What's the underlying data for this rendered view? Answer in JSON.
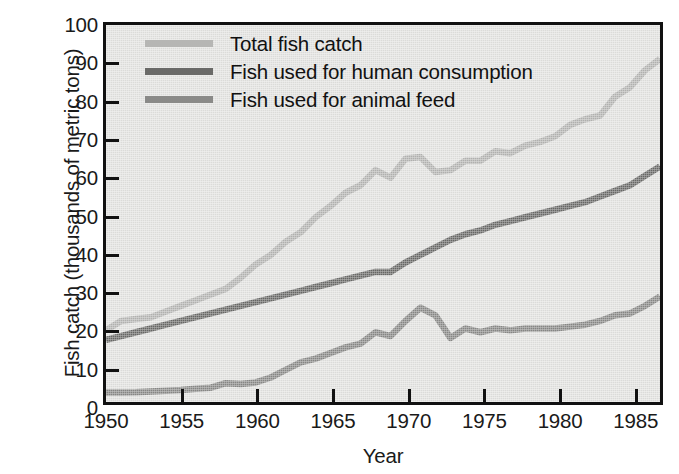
{
  "chart_data": {
    "type": "line",
    "title": "",
    "xlabel": "Year",
    "ylabel": "Fish catch (thousands of metric tons)",
    "xlim": [
      1950,
      1987
    ],
    "ylim": [
      0,
      100
    ],
    "xticks": [
      1950,
      1955,
      1960,
      1965,
      1970,
      1975,
      1980,
      1985
    ],
    "yticks": [
      0,
      10,
      20,
      30,
      40,
      50,
      60,
      70,
      80,
      90,
      100
    ],
    "grid": false,
    "legend_position": "top-left",
    "x": [
      1950,
      1951,
      1952,
      1953,
      1954,
      1955,
      1956,
      1957,
      1958,
      1959,
      1960,
      1961,
      1962,
      1963,
      1964,
      1965,
      1966,
      1967,
      1968,
      1969,
      1970,
      1971,
      1972,
      1973,
      1974,
      1975,
      1976,
      1977,
      1978,
      1979,
      1980,
      1981,
      1982,
      1983,
      1984,
      1985,
      1986,
      1987
    ],
    "series": [
      {
        "name": "Total fish catch",
        "color": "#b6b6b4",
        "values": [
          19.0,
          21.5,
          22.0,
          22.5,
          24.0,
          25.5,
          27.0,
          28.5,
          30.0,
          33.0,
          36.5,
          39.0,
          42.5,
          45.0,
          49.0,
          52.0,
          55.5,
          57.5,
          61.5,
          59.5,
          64.5,
          65.0,
          61.0,
          61.5,
          64.0,
          64.0,
          66.5,
          66.0,
          68.0,
          69.0,
          70.5,
          73.5,
          75.0,
          76.0,
          81.0,
          83.5,
          88.0,
          91.0
        ]
      },
      {
        "name": "Fish used for human consumption",
        "color": "#6a6a68",
        "values": [
          16.5,
          17.5,
          18.5,
          19.5,
          20.5,
          21.5,
          22.5,
          23.5,
          24.5,
          25.5,
          26.5,
          27.5,
          28.5,
          29.5,
          30.5,
          31.5,
          32.5,
          33.5,
          34.5,
          34.5,
          37.0,
          39.0,
          41.0,
          43.0,
          44.5,
          45.5,
          47.0,
          48.0,
          49.0,
          50.0,
          51.0,
          52.0,
          53.0,
          54.5,
          56.0,
          57.5,
          60.0,
          62.5
        ]
      },
      {
        "name": "Fish used for animal feed",
        "color": "#8a8a88",
        "values": [
          2.5,
          2.5,
          2.6,
          2.8,
          3.0,
          3.2,
          3.5,
          3.8,
          5.0,
          4.8,
          5.2,
          6.5,
          8.5,
          10.5,
          11.5,
          13.0,
          14.5,
          15.5,
          18.5,
          17.5,
          21.5,
          25.0,
          23.0,
          17.0,
          19.5,
          18.5,
          19.5,
          19.0,
          19.5,
          19.5,
          19.5,
          20.0,
          20.5,
          21.5,
          23.0,
          23.5,
          25.5,
          28.0
        ]
      }
    ]
  },
  "legend": {
    "items": [
      {
        "label": "Total fish catch",
        "color": "#b6b6b4"
      },
      {
        "label": "Fish used for human consumption",
        "color": "#6a6a68"
      },
      {
        "label": "Fish used for animal feed",
        "color": "#8a8a88"
      }
    ]
  },
  "axes": {
    "x_title": "Year",
    "y_title": "Fish catch (thousands of metric tons)"
  }
}
